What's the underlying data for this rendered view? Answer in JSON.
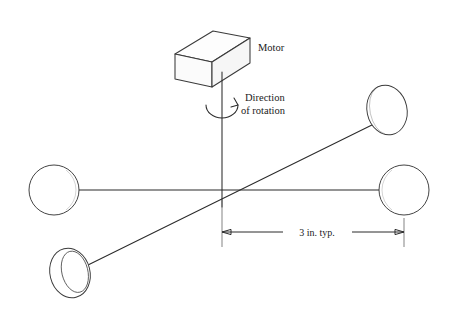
{
  "figure": {
    "background_color": "#ffffff",
    "line_color": "#2b2b2b"
  },
  "labels": {
    "motor": "Motor",
    "direction_line1": "Direction",
    "direction_line2": "of rotation",
    "dimension": "3 in. typ."
  },
  "components": {
    "motor_box": {
      "name": "motor",
      "shape": "isometric-rectangular-box"
    },
    "shaft": {
      "name": "vertical-drive-shaft"
    },
    "rotation_indicator": {
      "name": "rotation-arc-arrow",
      "shape": "curved-arrow"
    },
    "hub": {
      "name": "center-hub",
      "x": 222,
      "y": 190
    }
  },
  "spheres": [
    {
      "id": "left",
      "name": "sphere-left",
      "shape": "circle",
      "shading": "right",
      "cx": 54,
      "cy": 190,
      "r": 25
    },
    {
      "id": "right",
      "name": "sphere-right",
      "shape": "circle",
      "shading": "left",
      "cx": 404,
      "cy": 190,
      "r": 25
    },
    {
      "id": "upper-right",
      "name": "sphere-upper-right",
      "shape": "ellipse",
      "shading": "left",
      "cx": 387,
      "cy": 110,
      "rx": 20,
      "ry": 25
    },
    {
      "id": "lower-left",
      "name": "sphere-lower-left",
      "shape": "ellipse",
      "shading": "left",
      "cx": 70,
      "cy": 273,
      "rx": 20,
      "ry": 25
    }
  ],
  "arms": [
    {
      "name": "horizontal-arm",
      "from": "sphere-left",
      "to": "sphere-right"
    },
    {
      "name": "diagonal-arm",
      "from": "sphere-lower-left",
      "to": "sphere-upper-right"
    }
  ],
  "dimension": {
    "name": "dimension-3-in-typ",
    "value": "3 in. typ.",
    "from_x": 222,
    "to_x": 404,
    "y": 232
  }
}
